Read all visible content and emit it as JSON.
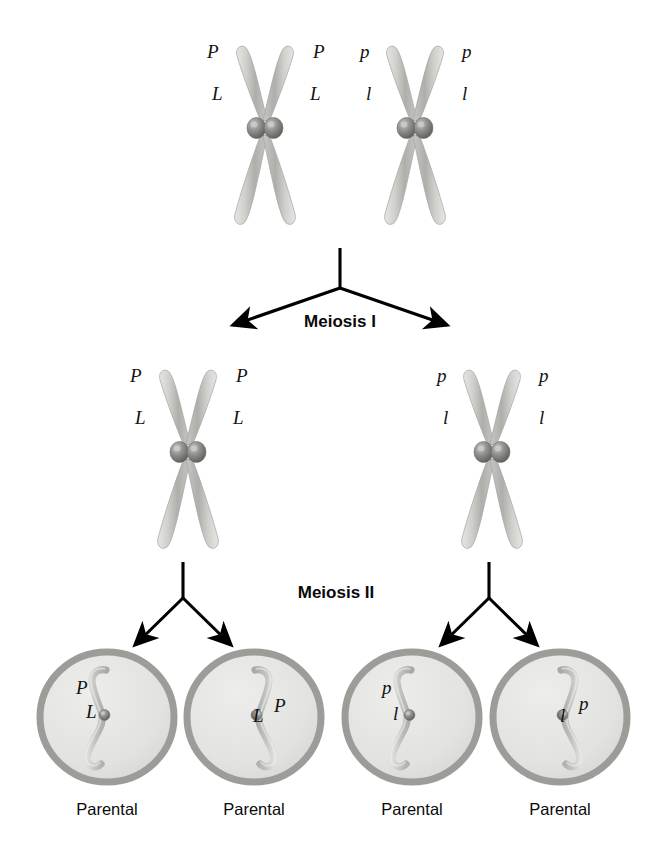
{
  "figure": {
    "background_color": "#ffffff"
  },
  "colors": {
    "chromosome_light": "#d8d8d6",
    "chromosome_mid": "#b9b9b6",
    "chromosome_dark": "#9a9a97",
    "chromosome_outline": "#a6a6a3",
    "centromere_light": "#b6b6b2",
    "centromere_dark": "#6e6e6b",
    "cell_membrane": "#9c9c99",
    "cell_cytoplasm": "#e4e4e2",
    "arrow_color": "#000000",
    "text_color": "#0a0a0a"
  },
  "stages": [
    {
      "name": "meiosis-i",
      "label": "Meiosis I"
    },
    {
      "name": "meiosis-ii",
      "label": "Meiosis II"
    }
  ],
  "rows": {
    "parent_cell": {
      "name": "homologous-pair-row",
      "chromosomes": [
        {
          "name": "chromosome-maternal",
          "cx": 265,
          "labels": [
            {
              "text": "P",
              "side": "left",
              "tier": "top"
            },
            {
              "text": "P",
              "side": "right",
              "tier": "top"
            },
            {
              "text": "L",
              "side": "left",
              "tier": "bottom"
            },
            {
              "text": "L",
              "side": "right",
              "tier": "bottom"
            }
          ]
        },
        {
          "name": "chromosome-paternal",
          "cx": 415,
          "labels": [
            {
              "text": "p",
              "side": "left",
              "tier": "top"
            },
            {
              "text": "p",
              "side": "right",
              "tier": "top"
            },
            {
              "text": "l",
              "side": "left",
              "tier": "bottom"
            },
            {
              "text": "l",
              "side": "right",
              "tier": "bottom"
            }
          ]
        }
      ]
    },
    "meiosis_one_products": {
      "name": "meiosis-one-products-row",
      "chromosomes": [
        {
          "name": "chromosome-secondary-left",
          "cx": 188,
          "labels": [
            {
              "text": "P",
              "side": "left",
              "tier": "top"
            },
            {
              "text": "P",
              "side": "right",
              "tier": "top"
            },
            {
              "text": "L",
              "side": "left",
              "tier": "bottom"
            },
            {
              "text": "L",
              "side": "right",
              "tier": "bottom"
            }
          ]
        },
        {
          "name": "chromosome-secondary-right",
          "cx": 492,
          "labels": [
            {
              "text": "p",
              "side": "left",
              "tier": "top"
            },
            {
              "text": "p",
              "side": "right",
              "tier": "top"
            },
            {
              "text": "l",
              "side": "left",
              "tier": "bottom"
            },
            {
              "text": "l",
              "side": "right",
              "tier": "bottom"
            }
          ]
        }
      ]
    },
    "gametes": {
      "name": "gamete-row",
      "cells": [
        {
          "name": "gamete-cell-1",
          "cx": 107,
          "orientation": "left",
          "allele_top": "P",
          "allele_bottom": "L",
          "caption": "Parental"
        },
        {
          "name": "gamete-cell-2",
          "cx": 254,
          "orientation": "right",
          "allele_top": "P",
          "allele_bottom": "L",
          "caption": "Parental"
        },
        {
          "name": "gamete-cell-3",
          "cx": 412,
          "orientation": "left",
          "allele_top": "p",
          "allele_bottom": "l",
          "caption": "Parental"
        },
        {
          "name": "gamete-cell-4",
          "cx": 560,
          "orientation": "right",
          "allele_top": "p",
          "allele_bottom": "l",
          "caption": "Parental"
        }
      ]
    }
  }
}
